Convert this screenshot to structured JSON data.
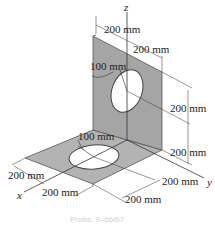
{
  "diagram": {
    "axes": {
      "x": "x",
      "y": "y",
      "z": "z"
    },
    "dimensions": {
      "top_left": "200 mm",
      "top_right": "200 mm",
      "vertical_hole_radius": "100 mm",
      "right_upper": "200 mm",
      "right_lower": "200 mm",
      "horizontal_hole_radius": "100 mm",
      "left_x": "200 mm",
      "bottom_x": "200 mm",
      "bottom_y": "200 mm",
      "right_y": "200 mm"
    },
    "colors": {
      "plate": "#a9a9a9",
      "plate_edge": "#555555",
      "lines": "#333333"
    },
    "caption": "Probs. 9–66/67"
  }
}
